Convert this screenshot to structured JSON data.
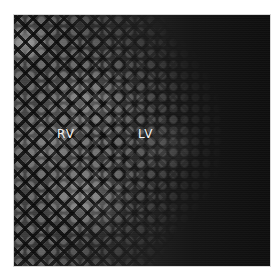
{
  "image": {
    "description": "Tagged cardiac MRI short-axis view with grid tagging pattern",
    "labels": {
      "rv": "RV",
      "lv": "LV"
    },
    "colors": {
      "background": "#121212",
      "label": "#f2f2f2",
      "border": "#ffffff"
    }
  }
}
